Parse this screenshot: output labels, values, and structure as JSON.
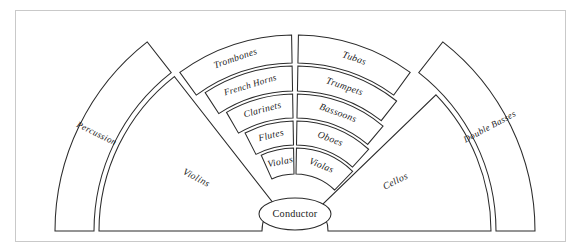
{
  "figure": {
    "type": "orchestra-seating-diagram",
    "center": {
      "x": 295,
      "y": 231
    },
    "frame": {
      "x": 15,
      "y": 10,
      "width": 551,
      "height": 232,
      "border_color": "#c9c9c9"
    },
    "stroke_color": "#2b2b2b",
    "fill_color": "#ffffff"
  },
  "conductor": {
    "label": "Conductor",
    "cx": 295,
    "cy": 214,
    "rx": 36,
    "ry": 16
  },
  "sections": [
    {
      "id": "percussion",
      "label": "Percussion",
      "group": "percussion",
      "shape": "arc-band",
      "r_inner": 201,
      "r_outer": 240,
      "a_start": 180,
      "a_end": 128,
      "label_angle": 154,
      "label_radius": 221,
      "label_rotation": "radial"
    },
    {
      "id": "violins",
      "label": "Violins",
      "group": "strings",
      "shape": "arc-band",
      "r_inner": 33,
      "r_outer": 196,
      "a_start": 180,
      "a_end": 128,
      "label_angle": 152,
      "label_radius": 112,
      "label_rotation": "radial"
    },
    {
      "id": "trombones",
      "label": "Trombones",
      "group": "brass",
      "shape": "arc-band",
      "r_inner": 168,
      "r_outer": 196,
      "a_start": 126,
      "a_end": 91,
      "label_angle": 109,
      "label_radius": 182,
      "label_rotation": "tangent"
    },
    {
      "id": "tubas",
      "label": "Tubas",
      "group": "brass",
      "shape": "arc-band",
      "r_inner": 168,
      "r_outer": 196,
      "a_start": 89,
      "a_end": 54,
      "label_angle": 71,
      "label_radius": 182,
      "label_rotation": "tangent"
    },
    {
      "id": "french-horns",
      "label": "French Horns",
      "group": "brass",
      "shape": "arc-band",
      "r_inner": 140,
      "r_outer": 165,
      "a_start": 123,
      "a_end": 91,
      "label_angle": 107,
      "label_radius": 152,
      "label_rotation": "tangent"
    },
    {
      "id": "trumpets",
      "label": "Trumpets",
      "group": "brass",
      "shape": "arc-band",
      "r_inner": 140,
      "r_outer": 165,
      "a_start": 89,
      "a_end": 52,
      "label_angle": 71,
      "label_radius": 152,
      "label_rotation": "tangent"
    },
    {
      "id": "clarinets",
      "label": "Clarinets",
      "group": "woodwinds",
      "shape": "arc-band",
      "r_inner": 113,
      "r_outer": 137,
      "a_start": 120,
      "a_end": 91,
      "label_angle": 105,
      "label_radius": 125,
      "label_rotation": "tangent"
    },
    {
      "id": "bassoons",
      "label": "Bassoons",
      "group": "woodwinds",
      "shape": "arc-band",
      "r_inner": 113,
      "r_outer": 137,
      "a_start": 89,
      "a_end": 50,
      "label_angle": 70,
      "label_radius": 125,
      "label_rotation": "tangent"
    },
    {
      "id": "flutes",
      "label": "Flutes",
      "group": "woodwinds",
      "shape": "arc-band",
      "r_inner": 86,
      "r_outer": 110,
      "a_start": 117,
      "a_end": 91,
      "label_angle": 104,
      "label_radius": 98,
      "label_rotation": "tangent"
    },
    {
      "id": "oboes",
      "label": "Oboes",
      "group": "woodwinds",
      "shape": "arc-band",
      "r_inner": 86,
      "r_outer": 110,
      "a_start": 89,
      "a_end": 48,
      "label_angle": 69,
      "label_radius": 98,
      "label_rotation": "tangent"
    },
    {
      "id": "violas-left",
      "label": "Violas",
      "group": "strings",
      "shape": "arc-band",
      "r_inner": 57,
      "r_outer": 83,
      "a_start": 114,
      "a_end": 91,
      "label_angle": 102,
      "label_radius": 70,
      "label_rotation": "tangent"
    },
    {
      "id": "violas-right",
      "label": "Violas",
      "group": "strings",
      "shape": "arc-band",
      "r_inner": 57,
      "r_outer": 83,
      "a_start": 89,
      "a_end": 46,
      "label_angle": 68,
      "label_radius": 70,
      "label_rotation": "tangent"
    },
    {
      "id": "cellos",
      "label": "Cellos",
      "group": "strings",
      "shape": "arc-band",
      "r_inner": 33,
      "r_outer": 196,
      "a_start": 44,
      "a_end": 0,
      "label_angle": 26,
      "label_radius": 112,
      "label_rotation": "radial"
    },
    {
      "id": "double-basses",
      "label": "Double Basses",
      "group": "strings",
      "shape": "arc-band",
      "r_inner": 201,
      "r_outer": 240,
      "a_start": 52,
      "a_end": 0,
      "label_angle": 28,
      "label_radius": 221,
      "label_rotation": "radial"
    }
  ]
}
